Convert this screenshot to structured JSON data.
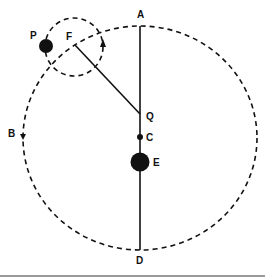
{
  "diagram": {
    "labels": {
      "A": "A",
      "B": "B",
      "C": "C",
      "D": "D",
      "E": "E",
      "F": "F",
      "P": "P",
      "Q": "Q"
    },
    "colors": {
      "ink": "#111111",
      "background": "#ffffff",
      "bottom_rule": "#777777"
    }
  }
}
